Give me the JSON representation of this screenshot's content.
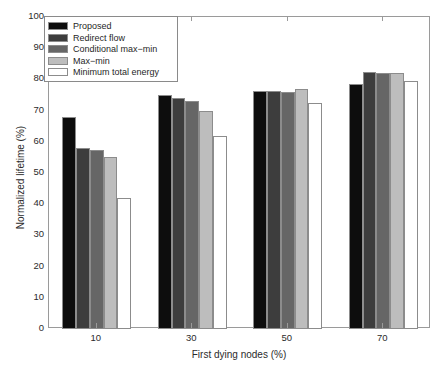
{
  "chart_data": {
    "type": "bar",
    "title": "",
    "xlabel": "First dying nodes (%)",
    "ylabel": "Normalized lifetime (%)",
    "categories": [
      "10",
      "30",
      "50",
      "70"
    ],
    "xtick_labels": [
      "10",
      "30",
      "50",
      "70"
    ],
    "ytick_labels": [
      "0",
      "10",
      "20",
      "30",
      "40",
      "50",
      "60",
      "70",
      "80",
      "90",
      "100"
    ],
    "ylim": [
      0,
      100
    ],
    "ytick_step": 10,
    "grid": false,
    "legend_position": "upper-left-inside",
    "series": [
      {
        "name": "Proposed",
        "color": "#0d0d0d",
        "values": [
          68.0,
          75.0,
          76.3,
          78.5
        ]
      },
      {
        "name": "Redirect flow",
        "color": "#3d3d3d",
        "values": [
          58.0,
          74.0,
          76.3,
          82.3
        ]
      },
      {
        "name": "Conditional max-min",
        "color": "#666666",
        "values": [
          57.5,
          73.2,
          76.0,
          82.2
        ]
      },
      {
        "name": "Max-min",
        "color": "#bdbdbd",
        "values": [
          55.0,
          69.8,
          77.0,
          82.2
        ]
      },
      {
        "name": "Minimum total energy",
        "color": "#ffffff",
        "values": [
          42.0,
          62.0,
          72.3,
          79.5
        ]
      }
    ]
  },
  "legend": {
    "items": [
      {
        "label": "Proposed"
      },
      {
        "label": "Redirect flow"
      },
      {
        "label": "Conditional max−min"
      },
      {
        "label": "Max−min"
      },
      {
        "label": "Minimum total energy"
      }
    ]
  },
  "colors": {
    "axis": "#9a9a9a",
    "bar_edge": "#8c8c8c",
    "text": "#2b2b2b",
    "background": "#ffffff"
  }
}
